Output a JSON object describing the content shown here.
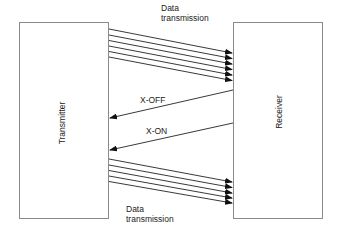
{
  "diagram": {
    "nodes": {
      "transmitter": {
        "label": "Transmitter"
      },
      "receiver": {
        "label": "Receiver"
      }
    },
    "labels": {
      "top_data_line1": "Data",
      "top_data_line2": "transmission",
      "xoff": "X-OFF",
      "xon": "X-ON",
      "bottom_data_line1": "Data",
      "bottom_data_line2": "transmission"
    },
    "edges": [
      {
        "from": "transmitter",
        "to": "receiver",
        "label": "Data transmission",
        "count": 6
      },
      {
        "from": "receiver",
        "to": "transmitter",
        "label": "X-OFF",
        "count": 1
      },
      {
        "from": "receiver",
        "to": "transmitter",
        "label": "X-ON",
        "count": 1
      },
      {
        "from": "transmitter",
        "to": "receiver",
        "label": "Data transmission",
        "count": 5
      }
    ],
    "colors": {
      "box_stroke": "#8a8a8a",
      "line": "#222222",
      "text": "#222222"
    }
  }
}
